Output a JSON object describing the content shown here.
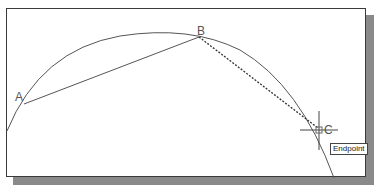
{
  "diagram": {
    "points": [
      {
        "label": "A",
        "x": 24,
        "y": 104
      },
      {
        "label": "B",
        "x": 199,
        "y": 37
      },
      {
        "label": "C",
        "x": 318,
        "y": 128
      }
    ],
    "tooltip": "Endpoint",
    "colors": {
      "line": "#555555",
      "frame": "#3a3a3a",
      "shadow": "#8a8a8a"
    }
  }
}
